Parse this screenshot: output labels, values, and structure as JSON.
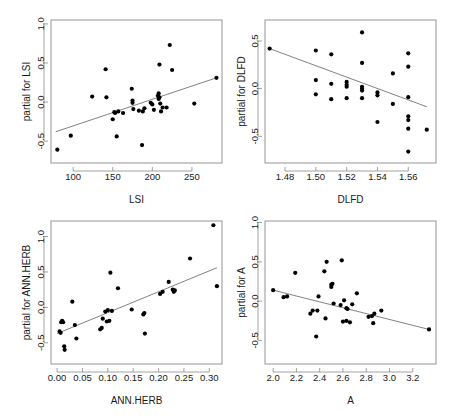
{
  "figure": {
    "layout": "2x2 grid of partial residual (partial effect) scatterplots",
    "background_color": "#ffffff",
    "point_color": "#000000",
    "line_color": "#6b6b6b",
    "frame_color": "#8a8a8a"
  },
  "chart_data": [
    {
      "id": "panel-lsi",
      "type": "scatter",
      "title": "",
      "xlabel": "LSI",
      "ylabel": "partial for LSI",
      "xlim": [
        72,
        288
      ],
      "ylim": [
        -0.78,
        1.05
      ],
      "xticks": [
        100,
        150,
        200,
        250
      ],
      "yticks": [
        -0.5,
        0.0,
        0.5,
        1.0
      ],
      "xticklabels": [
        "100",
        "150",
        "200",
        "250"
      ],
      "yticklabels": [
        "-0.5",
        "0.0",
        "0.5",
        "1.0"
      ],
      "grid": false,
      "legend": "none",
      "trend": {
        "type": "line",
        "x": [
          78,
          281
        ],
        "y": [
          -0.38,
          0.31
        ]
      },
      "points": [
        [
          80,
          -0.61
        ],
        [
          97,
          -0.43
        ],
        [
          124,
          0.07
        ],
        [
          141,
          0.42
        ],
        [
          142,
          0.06
        ],
        [
          150,
          -0.22
        ],
        [
          152,
          -0.13
        ],
        [
          153,
          -0.14
        ],
        [
          155,
          -0.44
        ],
        [
          157,
          -0.12
        ],
        [
          163,
          -0.14
        ],
        [
          174,
          0.17
        ],
        [
          175,
          -0.01
        ],
        [
          175,
          0.02
        ],
        [
          176,
          -0.09
        ],
        [
          183,
          -0.11
        ],
        [
          187,
          -0.55
        ],
        [
          188,
          -0.12
        ],
        [
          190,
          -0.08
        ],
        [
          198,
          -0.01
        ],
        [
          200,
          -0.03
        ],
        [
          202,
          -0.1
        ],
        [
          207,
          0.08
        ],
        [
          208,
          0.11
        ],
        [
          208,
          0.04
        ],
        [
          209,
          0.06
        ],
        [
          209,
          0.48
        ],
        [
          210,
          -0.02
        ],
        [
          211,
          -0.12
        ],
        [
          213,
          -0.07
        ],
        [
          218,
          -0.07
        ],
        [
          222,
          0.73
        ],
        [
          225,
          0.41
        ],
        [
          253,
          -0.02
        ],
        [
          281,
          0.31
        ]
      ]
    },
    {
      "id": "panel-dlfd",
      "type": "scatter",
      "title": "",
      "xlabel": "DLFD",
      "ylabel": "partial for DLFD",
      "xlim": [
        1.467,
        1.578
      ],
      "ylim": [
        -0.78,
        0.72
      ],
      "xticks": [
        1.48,
        1.5,
        1.52,
        1.54,
        1.56
      ],
      "yticks": [
        -0.5,
        0.0,
        0.5
      ],
      "xticklabels": [
        "1.48",
        "1.50",
        "1.52",
        "1.54",
        "1.56"
      ],
      "yticklabels": [
        "-0.5",
        "0.0",
        "0.5"
      ],
      "grid": false,
      "legend": "none",
      "trend": {
        "type": "line",
        "x": [
          1.47,
          1.572
        ],
        "y": [
          0.42,
          -0.19
        ]
      },
      "points": [
        [
          1.47,
          0.42
        ],
        [
          1.5,
          0.4
        ],
        [
          1.5,
          0.09
        ],
        [
          1.5,
          -0.06
        ],
        [
          1.51,
          0.36
        ],
        [
          1.51,
          0.05
        ],
        [
          1.51,
          -0.11
        ],
        [
          1.52,
          0.07
        ],
        [
          1.52,
          0.04
        ],
        [
          1.52,
          0.02
        ],
        [
          1.52,
          -0.1
        ],
        [
          1.53,
          0.59
        ],
        [
          1.53,
          0.27
        ],
        [
          1.53,
          0.02
        ],
        [
          1.53,
          0.0
        ],
        [
          1.53,
          -0.02
        ],
        [
          1.53,
          -0.1
        ],
        [
          1.54,
          -0.04
        ],
        [
          1.54,
          -0.07
        ],
        [
          1.54,
          -0.35
        ],
        [
          1.55,
          0.16
        ],
        [
          1.55,
          -0.16
        ],
        [
          1.56,
          0.37
        ],
        [
          1.56,
          0.23
        ],
        [
          1.56,
          -0.09
        ],
        [
          1.56,
          -0.29
        ],
        [
          1.56,
          -0.33
        ],
        [
          1.56,
          -0.42
        ],
        [
          1.56,
          -0.66
        ],
        [
          1.572,
          -0.43
        ]
      ]
    },
    {
      "id": "panel-annherb",
      "type": "scatter",
      "title": "",
      "xlabel": "ANN.HERB",
      "ylabel": "partial for ANN.HERB",
      "xlim": [
        -0.012,
        0.325
      ],
      "ylim": [
        -0.8,
        1.22
      ],
      "xticks": [
        0.0,
        0.05,
        0.1,
        0.15,
        0.2,
        0.25,
        0.3
      ],
      "yticks": [
        -0.5,
        0.0,
        0.5,
        1.0
      ],
      "xticklabels": [
        "0.00",
        "0.05",
        "0.10",
        "0.15",
        "0.20",
        "0.25",
        "0.30"
      ],
      "yticklabels": [
        "-0.5",
        "0.0",
        "0.5",
        "1.0"
      ],
      "grid": false,
      "legend": false,
      "trend": {
        "type": "line",
        "x": [
          0.0,
          0.315
        ],
        "y": [
          -0.37,
          0.56
        ]
      },
      "points": [
        [
          0.005,
          -0.34
        ],
        [
          0.007,
          -0.36
        ],
        [
          0.008,
          -0.21
        ],
        [
          0.01,
          -0.19
        ],
        [
          0.012,
          -0.21
        ],
        [
          0.014,
          -0.55
        ],
        [
          0.015,
          -0.6
        ],
        [
          0.03,
          0.08
        ],
        [
          0.035,
          -0.25
        ],
        [
          0.038,
          -0.44
        ],
        [
          0.085,
          -0.31
        ],
        [
          0.088,
          -0.29
        ],
        [
          0.09,
          -0.16
        ],
        [
          0.095,
          -0.06
        ],
        [
          0.098,
          -0.2
        ],
        [
          0.1,
          -0.04
        ],
        [
          0.103,
          -0.19
        ],
        [
          0.105,
          0.49
        ],
        [
          0.108,
          -0.05
        ],
        [
          0.12,
          0.27
        ],
        [
          0.147,
          -0.03
        ],
        [
          0.17,
          -0.1
        ],
        [
          0.172,
          -0.08
        ],
        [
          0.173,
          -0.37
        ],
        [
          0.203,
          0.19
        ],
        [
          0.208,
          0.22
        ],
        [
          0.22,
          0.36
        ],
        [
          0.228,
          0.25
        ],
        [
          0.23,
          0.22
        ],
        [
          0.232,
          0.24
        ],
        [
          0.262,
          0.69
        ],
        [
          0.308,
          1.16
        ],
        [
          0.315,
          0.3
        ]
      ]
    },
    {
      "id": "panel-a",
      "type": "scatter",
      "title": "",
      "xlabel": "A",
      "ylabel": "partial for A",
      "xlim": [
        1.93,
        3.4
      ],
      "ylim": [
        -0.8,
        1.02
      ],
      "xticks": [
        2.0,
        2.2,
        2.4,
        2.6,
        2.8,
        3.0,
        3.2
      ],
      "yticks": [
        -0.5,
        0.0,
        0.5,
        1.0
      ],
      "xticklabels": [
        "2.0",
        "2.2",
        "2.4",
        "2.6",
        "2.8",
        "3.0",
        "3.2"
      ],
      "yticklabels": [
        "-0.5",
        "0.0",
        "0.5",
        "1.0"
      ],
      "grid": false,
      "legend": "none",
      "trend": {
        "type": "line",
        "x": [
          2.0,
          3.34
        ],
        "y": [
          0.14,
          -0.36
        ]
      },
      "points": [
        [
          2.0,
          0.14
        ],
        [
          2.09,
          0.05
        ],
        [
          2.12,
          0.06
        ],
        [
          2.19,
          0.36
        ],
        [
          2.32,
          -0.16
        ],
        [
          2.34,
          -0.12
        ],
        [
          2.37,
          -0.45
        ],
        [
          2.38,
          -0.12
        ],
        [
          2.39,
          0.06
        ],
        [
          2.44,
          0.38
        ],
        [
          2.45,
          -0.22
        ],
        [
          2.46,
          0.5
        ],
        [
          2.5,
          0.18
        ],
        [
          2.5,
          0.21
        ],
        [
          2.51,
          0.22
        ],
        [
          2.52,
          -0.03
        ],
        [
          2.58,
          -0.05
        ],
        [
          2.59,
          0.52
        ],
        [
          2.6,
          -0.26
        ],
        [
          2.61,
          0.01
        ],
        [
          2.63,
          -0.09
        ],
        [
          2.63,
          -0.25
        ],
        [
          2.64,
          -0.1
        ],
        [
          2.66,
          -0.27
        ],
        [
          2.68,
          -0.04
        ],
        [
          2.72,
          0.1
        ],
        [
          2.82,
          -0.2
        ],
        [
          2.85,
          -0.19
        ],
        [
          2.86,
          -0.28
        ],
        [
          2.87,
          -0.16
        ],
        [
          2.93,
          -0.12
        ],
        [
          3.34,
          -0.36
        ]
      ]
    }
  ]
}
